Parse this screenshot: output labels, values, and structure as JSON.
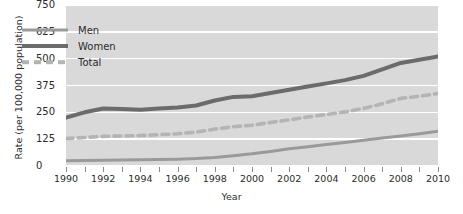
{
  "chart_data": {
    "type": "line",
    "title": "",
    "xlabel": "Year",
    "ylabel": "Rate (per 100,000 population)",
    "xlim": [
      1990,
      2010
    ],
    "ylim": [
      0,
      750
    ],
    "yticks": [
      0,
      125,
      250,
      375,
      500,
      625,
      750
    ],
    "xticks": [
      1990,
      1992,
      1994,
      1996,
      1998,
      2000,
      2002,
      2004,
      2006,
      2008,
      2010
    ],
    "x_minor_ticks": [
      1990,
      1991,
      1992,
      1993,
      1994,
      1995,
      1996,
      1997,
      1998,
      1999,
      2000,
      2001,
      2002,
      2003,
      2004,
      2005,
      2006,
      2007,
      2008,
      2009,
      2010
    ],
    "grid": "horizontal",
    "legend_position": "upper-left-inside",
    "x": [
      1990,
      1991,
      1992,
      1993,
      1994,
      1995,
      1996,
      1997,
      1998,
      1999,
      2000,
      2001,
      2002,
      2003,
      2004,
      2005,
      2006,
      2007,
      2008,
      2009,
      2010
    ],
    "series": [
      {
        "name": "Men",
        "style": "solid",
        "color": "#9a9a9a",
        "width": 3.0,
        "values": [
          25,
          26,
          27,
          28,
          29,
          30,
          32,
          35,
          40,
          48,
          57,
          68,
          80,
          90,
          100,
          110,
          120,
          130,
          140,
          150,
          162
        ]
      },
      {
        "name": "Women",
        "style": "solid",
        "color": "#6b6b6b",
        "width": 4.0,
        "values": [
          225,
          250,
          268,
          266,
          262,
          268,
          272,
          282,
          305,
          322,
          325,
          340,
          355,
          370,
          385,
          400,
          420,
          450,
          480,
          495,
          510
        ]
      },
      {
        "name": "Total",
        "style": "dashed",
        "color": "#b4b4b4",
        "width": 3.6,
        "values": [
          128,
          133,
          138,
          140,
          142,
          146,
          150,
          158,
          172,
          183,
          190,
          203,
          215,
          228,
          240,
          252,
          268,
          290,
          315,
          325,
          338
        ]
      }
    ]
  },
  "legend": {
    "items": [
      {
        "label": "Men"
      },
      {
        "label": "Women"
      },
      {
        "label": "Total"
      }
    ]
  },
  "axes": {
    "y_title": "Rate (per 100,000 population)",
    "x_title": "Year",
    "y_tick_labels": [
      "750",
      "625",
      "500",
      "375",
      "250",
      "125",
      "0"
    ],
    "x_tick_labels": [
      "1990",
      "1992",
      "1994",
      "1996",
      "1998",
      "2000",
      "2002",
      "2004",
      "2006",
      "2008",
      "2010"
    ]
  },
  "colors": {
    "panel_background": "#d9d9d9",
    "gridline": "#ffffff",
    "men": "#9a9a9a",
    "women": "#6b6b6b",
    "total": "#b4b4b4",
    "text": "#2b2b2b"
  }
}
